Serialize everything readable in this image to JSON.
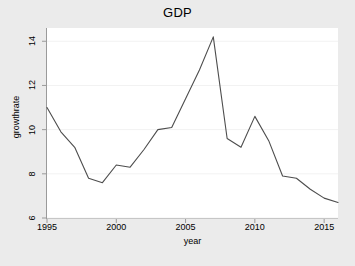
{
  "chart_data": {
    "type": "line",
    "title": "GDP",
    "xlabel": "year",
    "ylabel": "growthrate",
    "xlim": [
      1995,
      2016
    ],
    "ylim": [
      6,
      14.6
    ],
    "xticks": [
      1995,
      2000,
      2005,
      2010,
      2015
    ],
    "yticks": [
      6,
      8,
      10,
      12,
      14
    ],
    "grid": true,
    "legend": "none",
    "series": [
      {
        "name": "growthrate",
        "color": "#4d4d4d",
        "x": [
          1995,
          1996,
          1997,
          1998,
          1999,
          2000,
          2001,
          2002,
          2003,
          2004,
          2005,
          2006,
          2007,
          2008,
          2009,
          2010,
          2011,
          2012,
          2013,
          2014,
          2015,
          2016
        ],
        "values": [
          11.0,
          9.9,
          9.2,
          7.8,
          7.6,
          8.4,
          8.3,
          9.1,
          10.0,
          10.1,
          11.4,
          12.7,
          14.2,
          9.6,
          9.2,
          10.6,
          9.5,
          7.9,
          7.8,
          7.3,
          6.9,
          6.7
        ]
      }
    ]
  },
  "axis": {
    "x_tick_labels": [
      "1995",
      "2000",
      "2005",
      "2010",
      "2015"
    ],
    "y_tick_labels": [
      "6",
      "8",
      "10",
      "12",
      "14"
    ]
  },
  "colors": {
    "figure_background": "#ebebeb",
    "plot_background": "#ffffff",
    "line": "#4d4d4d",
    "axis": "#9a9a9a",
    "grid": "#f2f2f2",
    "text": "#000000"
  }
}
